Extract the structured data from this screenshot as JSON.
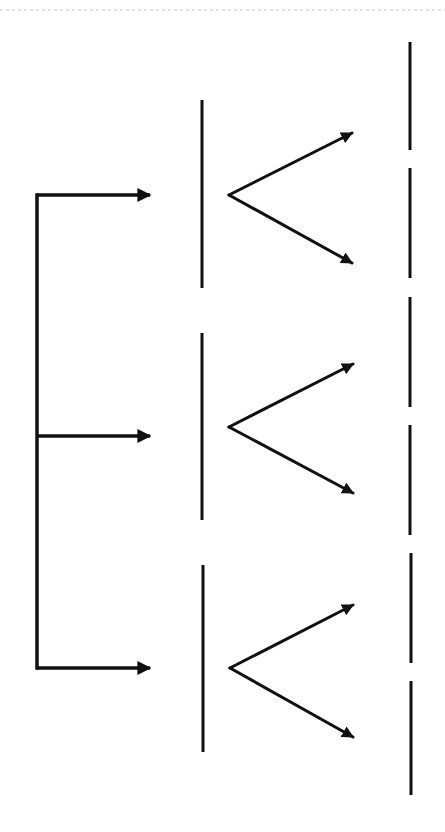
{
  "diagram": {
    "type": "tree-branching",
    "width": 445,
    "height": 832,
    "background": "#ffffff",
    "stroke_color": "#111111",
    "top_rule": {
      "y": 10,
      "x1": 0,
      "x2": 445,
      "color": "#c8c8c8",
      "dash": "3,3"
    },
    "root_bracket": {
      "x": 37,
      "y1": 195,
      "y2": 668,
      "stroke_width": 3.5
    },
    "branch_arrows": [
      {
        "y": 195,
        "x1": 37,
        "x2": 152
      },
      {
        "y": 436,
        "x1": 37,
        "x2": 152
      },
      {
        "y": 668,
        "x1": 37,
        "x2": 152
      }
    ],
    "middle_bars": [
      {
        "x": 202,
        "y1": 100,
        "y2": 288
      },
      {
        "x": 202,
        "y1": 333,
        "y2": 520
      },
      {
        "x": 203,
        "y1": 565,
        "y2": 752
      }
    ],
    "forks": [
      {
        "vertex": [
          229,
          195
        ],
        "upper_tip": [
          352,
          133
        ],
        "lower_tip": [
          352,
          263
        ]
      },
      {
        "vertex": [
          229,
          427
        ],
        "upper_tip": [
          353,
          364
        ],
        "lower_tip": [
          353,
          493
        ]
      },
      {
        "vertex": [
          230,
          668
        ],
        "upper_tip": [
          353,
          605
        ],
        "lower_tip": [
          353,
          737
        ]
      }
    ],
    "right_bars": [
      {
        "x": 410,
        "y1": 42,
        "y2": 150
      },
      {
        "x": 410,
        "y1": 168,
        "y2": 278
      },
      {
        "x": 410,
        "y1": 297,
        "y2": 407
      },
      {
        "x": 410,
        "y1": 425,
        "y2": 535
      },
      {
        "x": 411,
        "y1": 553,
        "y2": 663
      },
      {
        "x": 411,
        "y1": 681,
        "y2": 795
      }
    ],
    "labels": []
  }
}
